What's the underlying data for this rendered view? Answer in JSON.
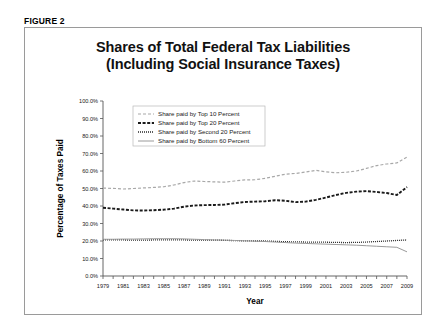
{
  "figure": {
    "label": "FIGURE 2"
  },
  "chart_data": {
    "type": "line",
    "title": "Shares of Total Federal Tax Liabilities (Including Social Insurance Taxes)",
    "title_line1": "Shares of Total Federal Tax Liabilities",
    "title_line2": "(Including Social Insurance Taxes)",
    "xlabel": "Year",
    "ylabel": "Percentage of Taxes Paid",
    "xlim": [
      1979,
      2009
    ],
    "ylim": [
      0,
      100
    ],
    "ytick_step": 10,
    "grid": false,
    "legend_position": "top-left-inside",
    "ytick_labels": [
      "0.0%",
      "10.0%",
      "20.0%",
      "30.0%",
      "40.0%",
      "50.0%",
      "60.0%",
      "70.0%",
      "80.0%",
      "90.0%",
      "100.0%"
    ],
    "ytick_values": [
      0,
      10,
      20,
      30,
      40,
      50,
      60,
      70,
      80,
      90,
      100
    ],
    "xtick_labels": [
      "1979",
      "1981",
      "1983",
      "1985",
      "1987",
      "1989",
      "1991",
      "1993",
      "1995",
      "1997",
      "1999",
      "2001",
      "2003",
      "2005",
      "2007",
      "2009"
    ],
    "xtick_values": [
      1979,
      1981,
      1983,
      1985,
      1987,
      1989,
      1991,
      1993,
      1995,
      1997,
      1999,
      2001,
      2003,
      2005,
      2007,
      2009
    ],
    "x": [
      1979,
      1980,
      1981,
      1982,
      1983,
      1984,
      1985,
      1986,
      1987,
      1988,
      1989,
      1990,
      1991,
      1992,
      1993,
      1994,
      1995,
      1996,
      1997,
      1998,
      1999,
      2000,
      2001,
      2002,
      2003,
      2004,
      2005,
      2006,
      2007,
      2008,
      2009
    ],
    "series": [
      {
        "name": "Share paid by Top 10 Percent",
        "style": "dashed-light",
        "color": "#a8a8a8",
        "values": [
          50.2,
          50.1,
          49.7,
          50.0,
          50.3,
          50.6,
          51.0,
          52.0,
          53.4,
          54.3,
          54.0,
          53.8,
          53.6,
          54.3,
          54.9,
          55.0,
          55.8,
          57.0,
          58.2,
          58.6,
          59.4,
          60.4,
          59.5,
          59.0,
          59.3,
          60.0,
          61.5,
          63.1,
          64.0,
          64.6,
          68.0
        ]
      },
      {
        "name": "Share paid by Top 20 Percent",
        "style": "dashed-dark",
        "color": "#1a1a1a",
        "values": [
          39.0,
          38.5,
          38.0,
          37.5,
          37.4,
          37.6,
          37.9,
          38.5,
          39.6,
          40.3,
          40.5,
          40.6,
          40.8,
          41.6,
          42.3,
          42.5,
          42.7,
          43.3,
          43.0,
          42.2,
          42.5,
          43.5,
          44.8,
          46.3,
          47.5,
          48.2,
          48.5,
          48.0,
          47.4,
          46.3,
          50.8
        ]
      },
      {
        "name": "Share paid by Second 20 Percent",
        "style": "dotted",
        "color": "#2a2a2a",
        "values": [
          20.6,
          20.6,
          20.6,
          20.5,
          20.5,
          20.6,
          20.7,
          20.7,
          20.6,
          20.5,
          20.5,
          20.5,
          20.4,
          20.2,
          20.1,
          20.0,
          20.0,
          19.8,
          19.6,
          19.5,
          19.4,
          19.3,
          19.3,
          19.2,
          19.1,
          19.2,
          19.4,
          19.7,
          20.0,
          20.3,
          20.6
        ]
      },
      {
        "name": "Share paid by Bottom 60 Percent",
        "style": "solid-light",
        "color": "#9a9a9a",
        "values": [
          21.0,
          21.0,
          21.1,
          21.1,
          21.2,
          21.3,
          21.3,
          21.3,
          21.2,
          21.0,
          20.8,
          20.6,
          20.5,
          20.3,
          20.1,
          19.9,
          19.7,
          19.4,
          19.1,
          18.8,
          18.6,
          18.4,
          18.2,
          18.0,
          17.8,
          17.6,
          17.3,
          17.0,
          16.7,
          16.4,
          13.8
        ]
      }
    ]
  }
}
